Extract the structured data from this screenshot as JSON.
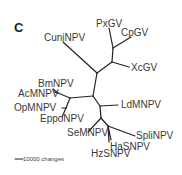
{
  "panel_label": "C",
  "taxa": {
    "cuni": "CuniNPV",
    "px": "PxGV",
    "cp": "CpGV",
    "xc": "XcGV",
    "bm": "BmNPV",
    "ac": "AcMNPV",
    "op": "OpMNPV",
    "eppo": "EppoNPV",
    "ld": "LdMNPV",
    "se": "SeMNPV",
    "spli": "SpliNPV",
    "ha": "HaSNPV",
    "hz": "HzSNPV"
  },
  "scale_bar": {
    "label": "10000 changes"
  }
}
